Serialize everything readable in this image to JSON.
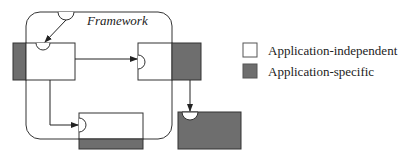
{
  "diagram": {
    "framework_label": "Framework",
    "colors": {
      "independent": "#ffffff",
      "specific": "#6e6e6e",
      "stroke": "#333333"
    },
    "components": [
      {
        "id": "c1",
        "kind": "mixed",
        "hook": "top"
      },
      {
        "id": "c2",
        "kind": "mixed",
        "hook": "left"
      },
      {
        "id": "c3",
        "kind": "mixed",
        "hook": "left"
      },
      {
        "id": "c4",
        "kind": "application-specific",
        "hook": "top"
      }
    ]
  },
  "legend": {
    "items": [
      {
        "label": "Application-independent",
        "color": "#ffffff"
      },
      {
        "label": "Application-specific",
        "color": "#6e6e6e"
      }
    ]
  }
}
